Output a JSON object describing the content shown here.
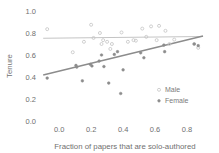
{
  "chart_data": {
    "type": "scatter",
    "title": "",
    "xlabel": "Fraction of papers that are solo-authored",
    "ylabel": "Tenure",
    "xlim": [
      -0.12,
      0.95
    ],
    "ylim": [
      0.0,
      1.0
    ],
    "xticks": [
      0.0,
      0.2,
      0.4,
      0.6,
      0.8
    ],
    "xtick_labels": [
      "0.0",
      "0.2",
      "0.4",
      "0.6",
      "0.8"
    ],
    "yticks": [
      0.0,
      0.2,
      0.4,
      0.6,
      0.8,
      1.0
    ],
    "ytick_labels": [
      "0.0",
      "0.2",
      "0.4",
      "0.6",
      "0.8",
      "1.0"
    ],
    "grid": false,
    "legend_position": "lower-right-inside",
    "series": [
      {
        "name": "Male",
        "color": "#c4c4c4",
        "marker": "circle-open",
        "points": [
          [
            -0.075,
            0.835
          ],
          [
            0.085,
            0.625
          ],
          [
            0.155,
            0.72
          ],
          [
            0.2,
            0.875
          ],
          [
            0.215,
            0.755
          ],
          [
            0.255,
            0.8
          ],
          [
            0.265,
            0.7
          ],
          [
            0.275,
            0.735
          ],
          [
            0.3,
            0.72
          ],
          [
            0.32,
            0.655
          ],
          [
            0.33,
            0.7
          ],
          [
            0.39,
            0.805
          ],
          [
            0.43,
            0.72
          ],
          [
            0.465,
            0.735
          ],
          [
            0.48,
            0.73
          ],
          [
            0.52,
            0.84
          ],
          [
            0.545,
            0.765
          ],
          [
            0.575,
            0.86
          ],
          [
            0.61,
            0.735
          ],
          [
            0.625,
            0.865
          ],
          [
            0.665,
            0.82
          ],
          [
            0.69,
            0.7
          ],
          [
            0.72,
            0.74
          ],
          [
            0.845,
            0.7
          ],
          [
            0.87,
            0.665
          ]
        ],
        "trend": {
          "x0": -0.1,
          "y0": 0.752,
          "x1": 0.9,
          "y1": 0.768
        }
      },
      {
        "name": "Female",
        "color": "#8c8c8c",
        "marker": "circle-filled",
        "points": [
          [
            -0.075,
            0.39
          ],
          [
            0.105,
            0.505
          ],
          [
            0.11,
            0.49
          ],
          [
            0.145,
            0.365
          ],
          [
            0.195,
            0.515
          ],
          [
            0.205,
            0.5
          ],
          [
            0.25,
            0.545
          ],
          [
            0.265,
            0.6
          ],
          [
            0.28,
            0.495
          ],
          [
            0.31,
            0.345
          ],
          [
            0.345,
            0.605
          ],
          [
            0.365,
            0.63
          ],
          [
            0.385,
            0.25
          ],
          [
            0.4,
            0.465
          ],
          [
            0.51,
            0.62
          ],
          [
            0.53,
            0.575
          ],
          [
            0.655,
            0.69
          ],
          [
            0.66,
            0.63
          ],
          [
            0.845,
            0.7
          ],
          [
            0.87,
            0.685
          ]
        ],
        "trend": {
          "x0": -0.1,
          "y0": 0.418,
          "x1": 0.9,
          "y1": 0.772
        }
      }
    ]
  },
  "legend": {
    "items": [
      {
        "label": "Male",
        "color": "#c4c4c4"
      },
      {
        "label": "Female",
        "color": "#8c8c8c"
      }
    ]
  },
  "axes": {
    "x_title": "Fraction of papers that are solo-authored",
    "y_title": "Tenure"
  }
}
